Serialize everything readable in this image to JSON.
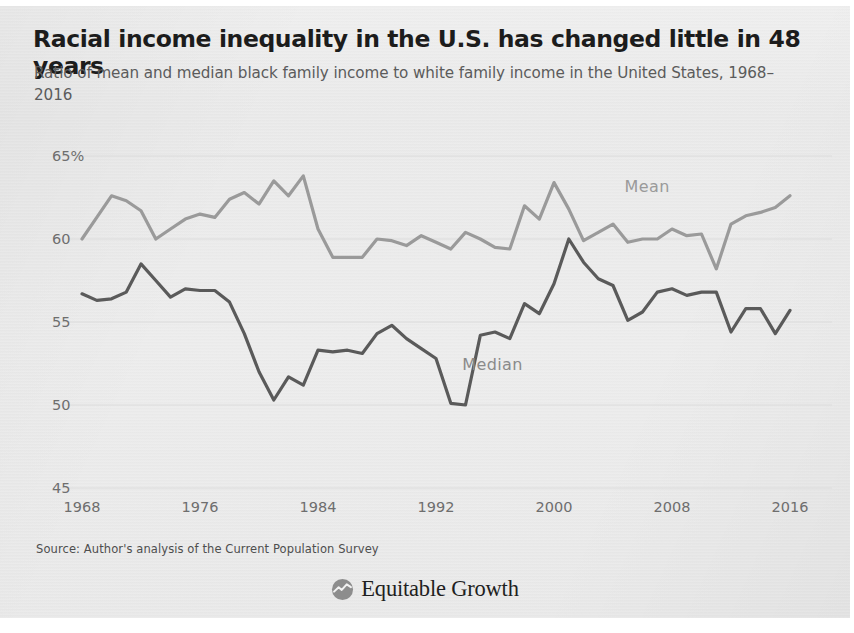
{
  "header": {
    "title": "Racial income inequality in the U.S. has changed little in 48 years",
    "subtitle": "Ratio of mean and median black family income to white family income in the United States, 1968–2016"
  },
  "footer": {
    "source": "Source: Author's analysis of the Current Population Survey",
    "brand": "Equitable Growth",
    "logo_icon": "chart-circle-icon"
  },
  "labels": {
    "mean": "Mean",
    "median": "Median"
  },
  "colors": {
    "mean_line": "#9a9a9a",
    "median_line": "#5a5a5a",
    "grid": "#dcdcdc",
    "axis_text": "#6e6e6e",
    "paper": "#eaeaea",
    "title_text": "#1c1c1c"
  },
  "chart_data": {
    "type": "line",
    "title": "Racial income inequality in the U.S. has changed little in 48 years",
    "subtitle": "Ratio of mean and median black family income to white family income in the United States, 1968–2016",
    "xlabel": "",
    "ylabel": "",
    "xlim": [
      1968,
      2016
    ],
    "ylim": [
      45,
      65
    ],
    "yticks": [
      45,
      50,
      55,
      60,
      65
    ],
    "ytick_labels": [
      "45",
      "50",
      "55",
      "60",
      "65%"
    ],
    "xticks": [
      1968,
      1976,
      1984,
      1992,
      2000,
      2008,
      2016
    ],
    "xtick_labels": [
      "1968",
      "1976",
      "1984",
      "1992",
      "2000",
      "2008",
      "2016"
    ],
    "grid": true,
    "legend": "inline-annotations",
    "x": [
      1968,
      1969,
      1970,
      1971,
      1972,
      1973,
      1974,
      1975,
      1976,
      1977,
      1978,
      1979,
      1980,
      1981,
      1982,
      1983,
      1984,
      1985,
      1986,
      1987,
      1988,
      1989,
      1990,
      1991,
      1992,
      1993,
      1994,
      1995,
      1996,
      1997,
      1998,
      1999,
      2000,
      2001,
      2002,
      2003,
      2004,
      2005,
      2006,
      2007,
      2008,
      2009,
      2010,
      2011,
      2012,
      2013,
      2014,
      2015,
      2016
    ],
    "series": [
      {
        "name": "Mean",
        "color": "#9a9a9a",
        "label_position": {
          "x": 2006,
          "y": 63.0
        },
        "values": [
          60.0,
          61.3,
          62.6,
          62.3,
          61.7,
          60.0,
          60.6,
          61.2,
          61.5,
          61.3,
          62.4,
          62.8,
          62.1,
          63.5,
          62.6,
          63.8,
          60.6,
          58.9,
          58.9,
          58.9,
          60.0,
          59.9,
          59.6,
          60.2,
          59.8,
          59.4,
          60.4,
          60.0,
          59.5,
          59.4,
          62.0,
          61.2,
          63.4,
          61.8,
          59.9,
          60.4,
          60.9,
          59.8,
          60.0,
          60.0,
          60.6,
          60.2,
          60.3,
          58.2,
          60.9,
          61.4,
          61.6,
          61.9,
          62.6
        ]
      },
      {
        "name": "Median",
        "color": "#5a5a5a",
        "label_position": {
          "x": 1995,
          "y": 52.3
        },
        "values": [
          56.7,
          56.3,
          56.4,
          56.8,
          58.5,
          57.5,
          56.5,
          57.0,
          56.9,
          56.9,
          56.2,
          54.3,
          52.0,
          50.3,
          51.7,
          51.2,
          53.3,
          53.2,
          53.3,
          53.1,
          54.3,
          54.8,
          54.0,
          53.4,
          52.8,
          50.1,
          50.0,
          54.2,
          54.4,
          54.0,
          56.1,
          55.5,
          57.3,
          60.0,
          58.6,
          57.6,
          57.2,
          55.1,
          55.6,
          56.8,
          57.0,
          56.6,
          56.8,
          56.8,
          54.4,
          55.8,
          55.8,
          54.3,
          55.7
        ]
      }
    ]
  }
}
